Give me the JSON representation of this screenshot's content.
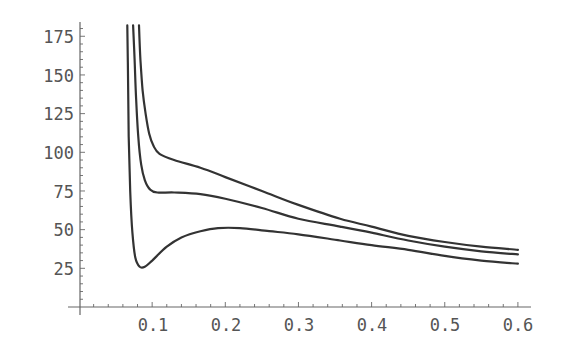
{
  "chart_data": {
    "type": "line",
    "title": "",
    "xlabel": "",
    "ylabel": "",
    "xlim": [
      0,
      0.615
    ],
    "ylim": [
      0,
      182
    ],
    "grid": false,
    "legend": null,
    "x_ticks": [
      "0.1",
      "0.2",
      "0.3",
      "0.4",
      "0.5",
      "0.6"
    ],
    "y_ticks": [
      "25",
      "50",
      "75",
      "100",
      "125",
      "150",
      "175"
    ],
    "series": [
      {
        "name": "upper curve",
        "points": [
          [
            0.082,
            182
          ],
          [
            0.084,
            160
          ],
          [
            0.087,
            140
          ],
          [
            0.091,
            125
          ],
          [
            0.096,
            112
          ],
          [
            0.102,
            104
          ],
          [
            0.11,
            99
          ],
          [
            0.13,
            95
          ],
          [
            0.166,
            90
          ],
          [
            0.2,
            84
          ],
          [
            0.25,
            75
          ],
          [
            0.3,
            66
          ],
          [
            0.357,
            57
          ],
          [
            0.4,
            52
          ],
          [
            0.45,
            46
          ],
          [
            0.5,
            42
          ],
          [
            0.55,
            39
          ],
          [
            0.6,
            37
          ]
        ]
      },
      {
        "name": "middle curve",
        "points": [
          [
            0.074,
            182
          ],
          [
            0.076,
            160
          ],
          [
            0.078,
            135
          ],
          [
            0.081,
            110
          ],
          [
            0.085,
            92
          ],
          [
            0.09,
            82
          ],
          [
            0.097,
            76
          ],
          [
            0.107,
            74
          ],
          [
            0.13,
            74
          ],
          [
            0.166,
            73
          ],
          [
            0.2,
            70
          ],
          [
            0.25,
            64
          ],
          [
            0.3,
            57
          ],
          [
            0.357,
            52
          ],
          [
            0.4,
            48
          ],
          [
            0.45,
            43
          ],
          [
            0.5,
            39
          ],
          [
            0.55,
            36
          ],
          [
            0.6,
            34
          ]
        ]
      },
      {
        "name": "lower curve",
        "points": [
          [
            0.066,
            182
          ],
          [
            0.067,
            150
          ],
          [
            0.068,
            110
          ],
          [
            0.07,
            75
          ],
          [
            0.073,
            48
          ],
          [
            0.077,
            32
          ],
          [
            0.083,
            26
          ],
          [
            0.09,
            26
          ],
          [
            0.1,
            30
          ],
          [
            0.12,
            39
          ],
          [
            0.14,
            45
          ],
          [
            0.166,
            49
          ],
          [
            0.19,
            51
          ],
          [
            0.22,
            51
          ],
          [
            0.26,
            49
          ],
          [
            0.3,
            47
          ],
          [
            0.357,
            43
          ],
          [
            0.4,
            40
          ],
          [
            0.45,
            37
          ],
          [
            0.5,
            33
          ],
          [
            0.55,
            30
          ],
          [
            0.6,
            28
          ]
        ]
      }
    ]
  }
}
